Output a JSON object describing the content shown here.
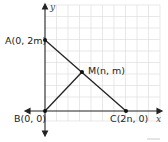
{
  "diagram": {
    "axes": {
      "x_label": "x",
      "y_label": "y"
    },
    "points": [
      {
        "id": "A",
        "label": "A(0, 2m)"
      },
      {
        "id": "M",
        "label": "M(n, m)"
      },
      {
        "id": "B",
        "label": "B(0, 0)"
      },
      {
        "id": "C",
        "label": "C(2n, 0)"
      }
    ],
    "colors": {
      "grid": "#dcdcdc",
      "line": "#222222"
    }
  }
}
